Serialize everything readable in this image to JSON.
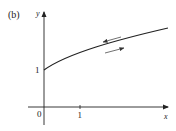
{
  "figure": {
    "panel_label": "(b)",
    "x_axis_label": "x",
    "y_axis_label": "y",
    "origin_label": "0",
    "x_tick_label": "1",
    "y_intercept_label": "1",
    "curve_description": "increasing concave curve starting at (0,1)",
    "direction_arrows": [
      "left-pointing arrow above curve",
      "right-pointing arrow below curve"
    ],
    "colors": {
      "ink": "#222222",
      "background": "#ffffff"
    }
  }
}
